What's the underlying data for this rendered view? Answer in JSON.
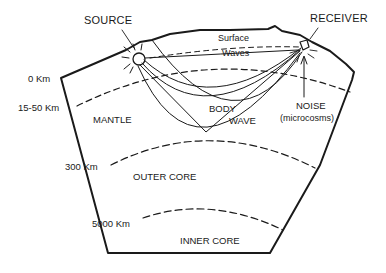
{
  "diagram": {
    "type": "earth cross-section (seismic wave paths)",
    "colors": {
      "ink": "#1a1a1a",
      "background": "#ffffff"
    },
    "labels": {
      "source": "SOURCE",
      "receiver": "RECEIVER",
      "surface_waves_line1": "Surface",
      "surface_waves_line2": "Waves",
      "body_wave_line1": "BODY",
      "body_wave_line2": "WAVE",
      "noise_line1": "NOISE",
      "noise_line2": "(microcosms)"
    },
    "layers": [
      {
        "name": "MANTLE"
      },
      {
        "name": "OUTER CORE"
      },
      {
        "name": "INNER CORE"
      }
    ],
    "depth_markers": [
      {
        "label": "0 Km"
      },
      {
        "label": "15-50 Km"
      },
      {
        "label": "300 Km"
      },
      {
        "label": "5000 Km"
      }
    ]
  }
}
